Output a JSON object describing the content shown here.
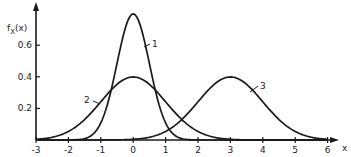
{
  "chart_data": {
    "type": "line",
    "title": "",
    "xlabel": "x",
    "ylabel": "f_X(x)",
    "xlim": [
      -3,
      6.3
    ],
    "ylim": [
      0,
      0.85
    ],
    "x_ticks": [
      "-3",
      "-2",
      "-1",
      "0",
      "1",
      "2",
      "3",
      "4",
      "5",
      "6"
    ],
    "y_ticks": [
      "0.2",
      "0.4",
      "0.6"
    ],
    "grid": false,
    "legend": "none (curves labelled inline 1, 2, 3)",
    "series": [
      {
        "name": "1",
        "description": "normal density, mean 0, std 0.5",
        "mean": 0,
        "std": 0.5,
        "peak": 0.8
      },
      {
        "name": "2",
        "description": "normal density, mean 0, std 1",
        "mean": 0,
        "std": 1,
        "peak": 0.4
      },
      {
        "name": "3",
        "description": "normal density, mean 3, std 1",
        "mean": 3,
        "std": 1,
        "peak": 0.4
      }
    ]
  },
  "labels": {
    "y_axis": "f",
    "y_axis_sub": "X",
    "y_axis_arg": "(x)",
    "x_axis": "x",
    "curve1": "1",
    "curve2": "2",
    "curve3": "3"
  }
}
